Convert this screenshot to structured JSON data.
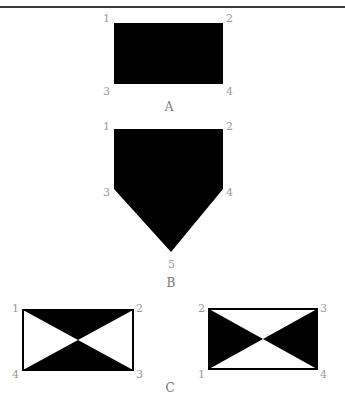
{
  "figures": {
    "A": {
      "label": "A",
      "corners": [
        "1",
        "2",
        "3",
        "4"
      ]
    },
    "B": {
      "label": "B",
      "corners": [
        "1",
        "2",
        "3",
        "4",
        "5"
      ]
    },
    "C": {
      "label": "C",
      "left": {
        "corners": [
          "1",
          "2",
          "3",
          "4"
        ]
      },
      "right": {
        "corners": [
          "1",
          "2",
          "3",
          "4"
        ]
      }
    }
  },
  "colors": {
    "fill": "#000000",
    "label": "#9a9a9a",
    "caption": "#777777"
  }
}
